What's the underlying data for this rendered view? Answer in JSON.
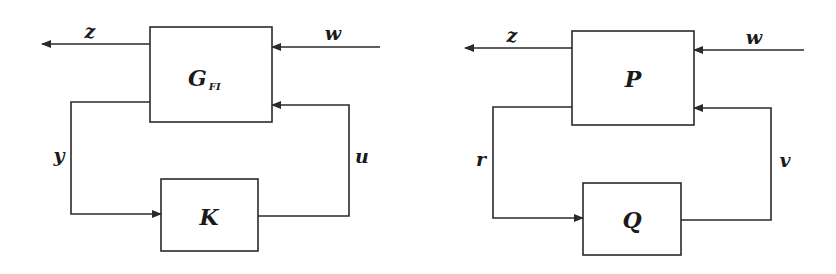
{
  "diagrams": [
    {
      "name": "full-information-loop",
      "plant_label": "G",
      "plant_subscript": "FI",
      "controller_label": "K",
      "signals": {
        "output": "z",
        "disturbance": "w",
        "measurement": "y",
        "control": "u"
      }
    },
    {
      "name": "q-parameterization-loop",
      "plant_label": "P",
      "controller_label": "Q",
      "signals": {
        "output": "z",
        "disturbance": "w",
        "measurement": "r",
        "control": "v"
      }
    }
  ],
  "colors": {
    "stroke": "#2a2a2a",
    "background": "#ffffff"
  }
}
